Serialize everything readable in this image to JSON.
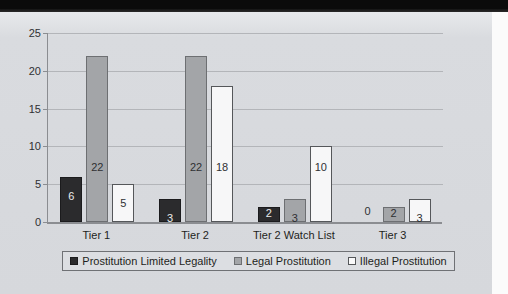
{
  "chart_data": {
    "type": "bar",
    "title": "",
    "xlabel": "",
    "ylabel": "",
    "ylim": [
      0,
      25
    ],
    "ytick_step": 5,
    "yticks": [
      "0",
      "5",
      "10",
      "15",
      "20",
      "25"
    ],
    "grid": true,
    "legend_position": "bottom",
    "categories": [
      "Tier 1",
      "Tier 2",
      "Tier 2 Watch List",
      "Tier 3"
    ],
    "series": [
      {
        "name": "Prostitution Limited Legality",
        "values": [
          6,
          3,
          2,
          0
        ],
        "color": "#2b2b2d",
        "labels": [
          "6",
          "3",
          "2",
          "0"
        ]
      },
      {
        "name": "Legal Prostitution",
        "values": [
          22,
          22,
          3,
          2
        ],
        "color": "#a3a5a8",
        "labels": [
          "22",
          "22",
          "3",
          "2"
        ]
      },
      {
        "name": "Illegal Prostitution",
        "values": [
          5,
          18,
          10,
          3
        ],
        "color": "#f7f7f8",
        "labels": [
          "5",
          "18",
          "10",
          "3"
        ]
      }
    ]
  },
  "legend": {
    "items": [
      {
        "label": "Prostitution Limited Legality",
        "swatch": "dark-square-swatch"
      },
      {
        "label": "Legal Prostitution",
        "swatch": "gray-square-swatch"
      },
      {
        "label": "Illegal Prostitution",
        "swatch": "white-square-swatch"
      }
    ]
  }
}
